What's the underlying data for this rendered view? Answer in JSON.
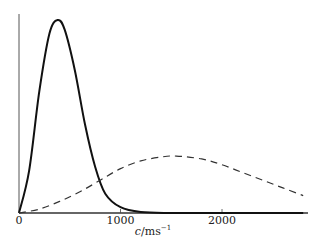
{
  "chart_data": {
    "type": "line",
    "title": "",
    "xlabel": "c/ms⁻¹",
    "xlabel_parts": {
      "var": "c",
      "unit": "/ms",
      "exp": "−1"
    },
    "ylabel": "",
    "xlim": [
      0,
      2800
    ],
    "xticks": [
      {
        "value": 0,
        "label": "0"
      },
      {
        "value": 1000,
        "label": "1000"
      },
      {
        "value": 2000,
        "label": "2000"
      }
    ],
    "grid": false,
    "legend": null,
    "series": [
      {
        "name": "solid",
        "style": "solid",
        "description": "narrow, tall speed distribution peaking near 380 m/s",
        "x": [
          0,
          100,
          200,
          300,
          380,
          450,
          550,
          650,
          750,
          850,
          1000,
          1200,
          1500,
          2000,
          2800
        ],
        "y": [
          0,
          0.22,
          0.63,
          0.93,
          1.0,
          0.95,
          0.74,
          0.46,
          0.24,
          0.1,
          0.03,
          0.005,
          0,
          0,
          0
        ]
      },
      {
        "name": "dashed",
        "style": "dashed",
        "description": "broad, low speed distribution peaking near 1550 m/s",
        "x": [
          0,
          200,
          400,
          600,
          800,
          1000,
          1200,
          1400,
          1550,
          1800,
          2000,
          2200,
          2400,
          2600,
          2800
        ],
        "y": [
          0,
          0.02,
          0.06,
          0.11,
          0.17,
          0.23,
          0.27,
          0.29,
          0.295,
          0.28,
          0.25,
          0.21,
          0.17,
          0.13,
          0.09
        ]
      }
    ]
  }
}
